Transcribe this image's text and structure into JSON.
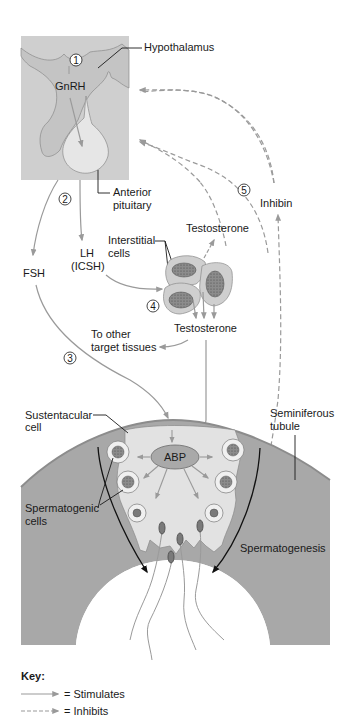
{
  "labels": {
    "hypothalamus": "Hypothalamus",
    "gnrh": "GnRH",
    "anterior_pituitary_1": "Anterior",
    "anterior_pituitary_2": "pituitary",
    "fsh": "FSH",
    "lh_1": "LH",
    "lh_2": "(ICSH)",
    "interstitial_1": "Interstitial",
    "interstitial_2": "cells",
    "testosterone_upper": "Testosterone",
    "testosterone_lower": "Testosterone",
    "inhibin": "Inhibin",
    "other_targets_1": "To other",
    "other_targets_2": "target tissues",
    "sustentacular_1": "Sustentacular",
    "sustentacular_2": "cell",
    "seminiferous_1": "Seminiferous",
    "seminiferous_2": "tubule",
    "abp": "ABP",
    "spermatogenic_1": "Spermatogenic",
    "spermatogenic_2": "cells",
    "spermatogenesis": "Spermatogenesis"
  },
  "steps": [
    "1",
    "2",
    "3",
    "4",
    "5"
  ],
  "key": {
    "title": "Key:",
    "stimulates": "= Stimulates",
    "inhibits": "= Inhibits"
  },
  "colors": {
    "pituitary_box": "#cfcfcf",
    "hypothalamus_fill": "#c4c4c4",
    "pituitary_gland": "#e6e6e6",
    "tubule_wall": "#a8a8a8",
    "sustentacular_fill": "#e2e2e2",
    "abp_fill": "#a9a9a9",
    "arrow_gray": "#9a9a9a",
    "text": "#1a1a1a"
  }
}
